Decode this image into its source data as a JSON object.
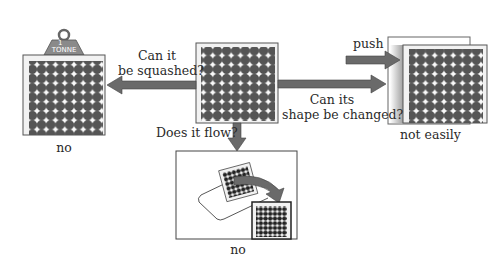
{
  "diagram": {
    "weight_label_top": "1",
    "weight_label_bottom": "TONNE",
    "q_squash_line1": "Can it",
    "q_squash_line2": "be squashed?",
    "q_shape_line1": "Can its",
    "q_shape_line2": "shape be changed?",
    "q_flow": "Does it flow?",
    "push_label": "push",
    "answer_squash": "no",
    "answer_shape": "not easily",
    "answer_flow": "no"
  },
  "colors": {
    "particle": "#555555",
    "arrow": "#6a6a6a",
    "box_bg": "#f2f2f2",
    "weight": "#8a8a8a"
  },
  "grid": {
    "rows": 8,
    "cols": 8
  }
}
